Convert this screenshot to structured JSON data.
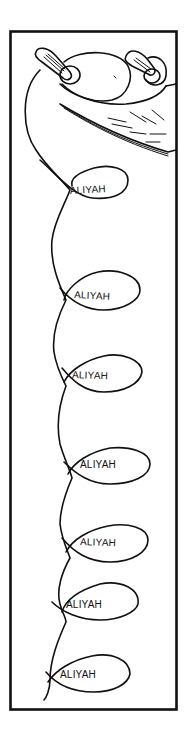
{
  "illustration": {
    "subject": "torah-scroll-with-aliyah-thread",
    "labels": [
      {
        "text": "ALIYAH",
        "x": 70,
        "y": 194,
        "rot": -3
      },
      {
        "text": "ALIYAH",
        "x": 74,
        "y": 298,
        "rot": 3
      },
      {
        "text": "ALIYAH",
        "x": 72,
        "y": 378,
        "rot": 2
      },
      {
        "text": "ALIYAH",
        "x": 80,
        "y": 468,
        "rot": 0
      },
      {
        "text": "ALIYAH",
        "x": 80,
        "y": 545,
        "rot": 2
      },
      {
        "text": "ALIYAH",
        "x": 66,
        "y": 608,
        "rot": 0
      },
      {
        "text": "ALIYAH",
        "x": 60,
        "y": 678,
        "rot": 0
      }
    ],
    "ink_color": "#111111",
    "background_color": "#ffffff"
  }
}
